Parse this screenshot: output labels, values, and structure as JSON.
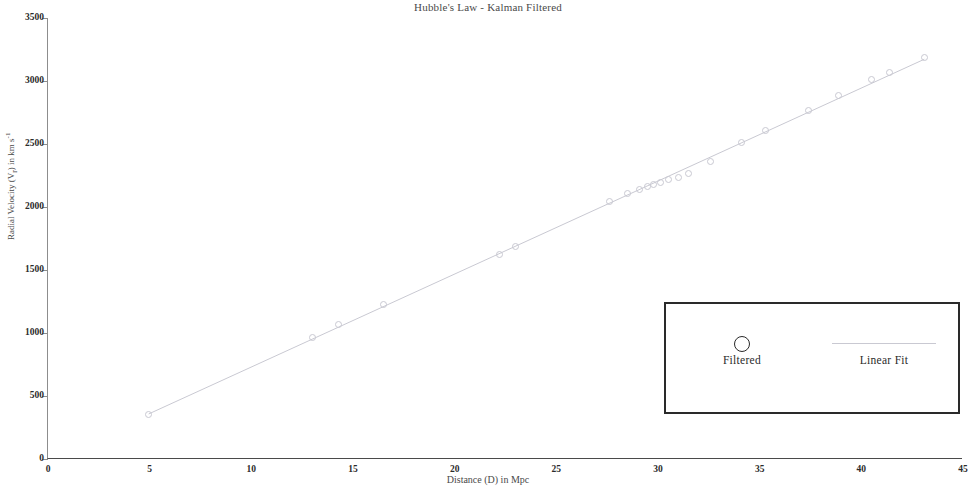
{
  "chart_data": {
    "type": "scatter",
    "title": "Hubble's Law - Kalman Filtered",
    "xlabel": "Distance (D) in Mpc",
    "ylabel_text": "Radial Velocity (V",
    "ylabel_sub": "r",
    "ylabel_tail": ") in km s",
    "ylabel_sup": "-1",
    "ylabel_full": "Radial Velocity (Vr) in km s-1",
    "xlim": [
      0,
      45
    ],
    "ylim": [
      0,
      3500
    ],
    "xticks": [
      0,
      5,
      10,
      15,
      20,
      25,
      30,
      35,
      40,
      45
    ],
    "yticks": [
      0,
      500,
      1000,
      1500,
      2000,
      2500,
      3000,
      3500
    ],
    "grid": false,
    "legend_position": "lower right",
    "marker_color": "#c9c9d2",
    "line_color": "#c9c9d2",
    "axis_color": "#4a4a4a",
    "series": [
      {
        "name": "Filtered",
        "marker": "open-circle",
        "points": [
          {
            "x": 4.95,
            "y": 350
          },
          {
            "x": 13.0,
            "y": 965
          },
          {
            "x": 14.3,
            "y": 1065
          },
          {
            "x": 16.5,
            "y": 1225
          },
          {
            "x": 22.2,
            "y": 1620
          },
          {
            "x": 23.0,
            "y": 1685
          },
          {
            "x": 27.6,
            "y": 2045
          },
          {
            "x": 28.5,
            "y": 2105
          },
          {
            "x": 29.1,
            "y": 2140
          },
          {
            "x": 29.5,
            "y": 2165
          },
          {
            "x": 29.8,
            "y": 2180
          },
          {
            "x": 30.1,
            "y": 2195
          },
          {
            "x": 30.5,
            "y": 2215
          },
          {
            "x": 31.0,
            "y": 2235
          },
          {
            "x": 31.5,
            "y": 2265
          },
          {
            "x": 32.6,
            "y": 2360
          },
          {
            "x": 34.1,
            "y": 2510
          },
          {
            "x": 35.3,
            "y": 2605
          },
          {
            "x": 37.4,
            "y": 2765
          },
          {
            "x": 38.9,
            "y": 2885
          },
          {
            "x": 40.5,
            "y": 3010
          },
          {
            "x": 41.4,
            "y": 3070
          },
          {
            "x": 43.1,
            "y": 3190
          }
        ]
      },
      {
        "name": "Linear Fit",
        "type": "line",
        "slope": 73.8,
        "intercept": -8,
        "x_start": 4.95,
        "x_end": 43.1
      }
    ],
    "legend": [
      {
        "label": "Filtered",
        "symbol": "open-circle"
      },
      {
        "label": "Linear Fit",
        "symbol": "line"
      }
    ]
  }
}
